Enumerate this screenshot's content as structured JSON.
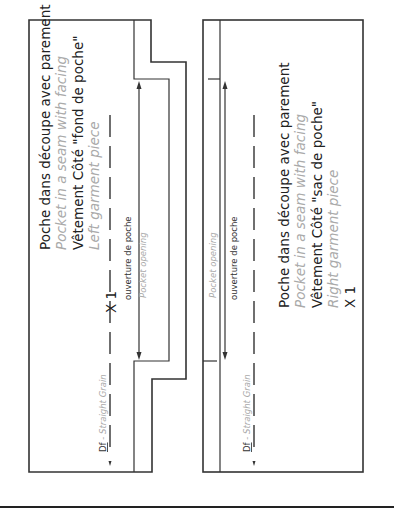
{
  "left_piece": {
    "title_fr": "Poche dans découpe avec parement",
    "title_en": "Pocket in a seam with facing",
    "garment_fr": "Vêtement Côté \"fond de poche\"",
    "garment_en": "Left garment piece",
    "quantity": "X 1",
    "opening_fr": "ouverture de poche",
    "opening_en": "Pocket opening",
    "grain_fr": "Df",
    "grain_en": " - Straight Grain"
  },
  "right_piece": {
    "title_fr": "Poche dans découpe avec parement",
    "title_en": "Pocket in a seam with facing",
    "garment_fr": "Vêtement Côté \"sac de poche\"",
    "garment_en": "Right garment piece",
    "quantity": "X 1",
    "opening_fr": "ouverture de poche",
    "opening_en": "Pocket opening",
    "grain_fr": "Df",
    "grain_en": " - Straight Grain"
  },
  "colors": {
    "line": "#333333",
    "text": "#222222",
    "english_text": "#aaaaaa"
  }
}
